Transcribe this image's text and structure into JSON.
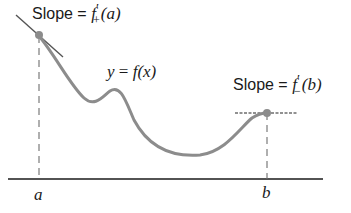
{
  "diagram": {
    "title": "",
    "labels": {
      "slope_a_prefix": "Slope = ",
      "slope_a_func": "f",
      "slope_a_sub": "+",
      "slope_a_prime": "′",
      "slope_a_arg": "(a)",
      "curve_y": "y",
      "curve_eq": " = ",
      "curve_f": "f",
      "curve_arg": "(x)",
      "slope_b_prefix": "Slope = ",
      "slope_b_func": "f",
      "slope_b_sub": "−",
      "slope_b_prime": "′",
      "slope_b_arg": "(b)",
      "axis_a": "a",
      "axis_b": "b"
    },
    "colors": {
      "curve": "#8c8c8c",
      "axis": "#1a1a1a",
      "dashed": "#6e6e6e",
      "point": "#8c8c8c",
      "tangent": "#555555"
    }
  }
}
